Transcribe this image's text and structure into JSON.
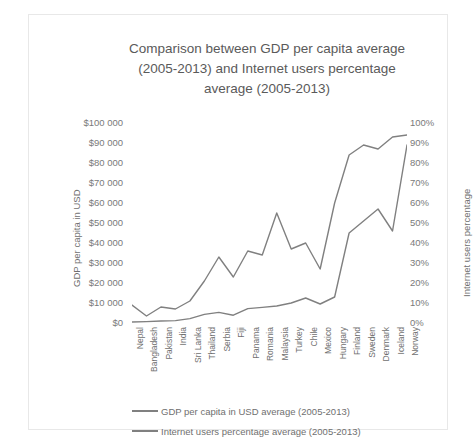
{
  "chart_data": {
    "type": "line",
    "title": "Comparison between GDP per capita average (2005-2013) and Internet users percentage average (2005-2013)",
    "title_lines": [
      "Comparison between GDP per capita average",
      "(2005-2013) and Internet users percentage",
      "average (2005-2013)"
    ],
    "xlabel": "",
    "ylabel": "GDP per capita in USD",
    "y2label": "Internet users percentage",
    "ylim": [
      0,
      100000
    ],
    "y2lim": [
      0,
      100
    ],
    "grid": false,
    "legend_position": "bottom",
    "categories": [
      "Nepal",
      "Bangladesh",
      "Pakistan",
      "India",
      "Sri Lanka",
      "Thailand",
      "Serbia",
      "Fiji",
      "Panama",
      "Romania",
      "Malaysia",
      "Turkey",
      "Chile",
      "Mexico",
      "Hungary",
      "Finland",
      "Sweden",
      "Denmark",
      "Iceland",
      "Norway"
    ],
    "y_left_ticks": [
      "$100 000",
      "$90 000",
      "$80 000",
      "$70 000",
      "$60 000",
      "$50 000",
      "$40 000",
      "$30 000",
      "$20 000",
      "$10 000",
      "$0"
    ],
    "y_right_ticks": [
      "100%",
      "90%",
      "80%",
      "70%",
      "60%",
      "50%",
      "40%",
      "30%",
      "20%",
      "10%",
      "0%"
    ],
    "series": [
      {
        "name": "GDP per capita in USD average (2005-2013)",
        "axis": "left",
        "color": "#808080",
        "values": [
          500,
          700,
          1000,
          1200,
          2200,
          4300,
          5300,
          3900,
          7200,
          7800,
          8500,
          10000,
          12500,
          9500,
          13000,
          45000,
          51000,
          57000,
          46000,
          89000
        ]
      },
      {
        "name": "Internet users percentage average (2005-2013)",
        "axis": "right",
        "color": "#808080",
        "values": [
          9,
          3.5,
          8,
          7,
          11,
          21,
          33,
          23,
          36,
          34,
          55,
          37,
          40,
          27,
          60,
          84,
          89,
          87,
          93,
          94
        ]
      }
    ]
  },
  "legend": {
    "items": [
      {
        "label": "GDP per capita in USD average (2005-2013)"
      },
      {
        "label": "Internet users percentage average (2005-2013)"
      }
    ]
  }
}
